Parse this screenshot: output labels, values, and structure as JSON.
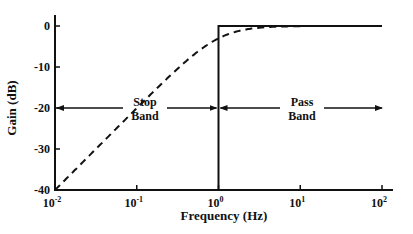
{
  "chart_data": {
    "type": "line",
    "title": "",
    "xlabel": "Frequency (Hz)",
    "ylabel": "Gain (dB)",
    "xscale": "log",
    "xlim": [
      0.01,
      100
    ],
    "ylim": [
      -40,
      0
    ],
    "x_ticks": [
      {
        "base": "10",
        "exp": "-2",
        "value": 0.01
      },
      {
        "base": "10",
        "exp": "-1",
        "value": 0.1
      },
      {
        "base": "10",
        "exp": "0",
        "value": 1
      },
      {
        "base": "10",
        "exp": "1",
        "value": 10
      },
      {
        "base": "10",
        "exp": "2",
        "value": 100
      }
    ],
    "y_ticks": [
      {
        "label": "0",
        "value": 0
      },
      {
        "label": "-10",
        "value": -10
      },
      {
        "label": "-20",
        "value": -20
      },
      {
        "label": "-30",
        "value": -30
      },
      {
        "label": "-40",
        "value": -40
      }
    ],
    "grid": false,
    "legend": null,
    "series": [
      {
        "name": "Ideal high-pass response",
        "style": "solid",
        "x": [
          1,
          1,
          100
        ],
        "y": [
          -40,
          0,
          0
        ]
      },
      {
        "name": "First-order high-pass response",
        "style": "dashed",
        "cutoff_hz": 1,
        "x": [
          0.01,
          0.02,
          0.05,
          0.1,
          0.2,
          0.5,
          1,
          2,
          5,
          10,
          20,
          50,
          100
        ],
        "y": [
          -40.0,
          -34.0,
          -26.0,
          -20.0,
          -14.1,
          -7.0,
          -3.0,
          -1.0,
          -0.2,
          -0.04,
          -0.01,
          0.0,
          0.0
        ]
      }
    ],
    "annotations": [
      {
        "text_lines": [
          "Stop",
          "Band"
        ],
        "arrow": "double-headed",
        "from_x": 0.01,
        "to_x": 1,
        "y": -20
      },
      {
        "text_lines": [
          "Pass",
          "Band"
        ],
        "arrow": "double-headed",
        "from_x": 1,
        "to_x": 100,
        "y": -20
      }
    ]
  }
}
